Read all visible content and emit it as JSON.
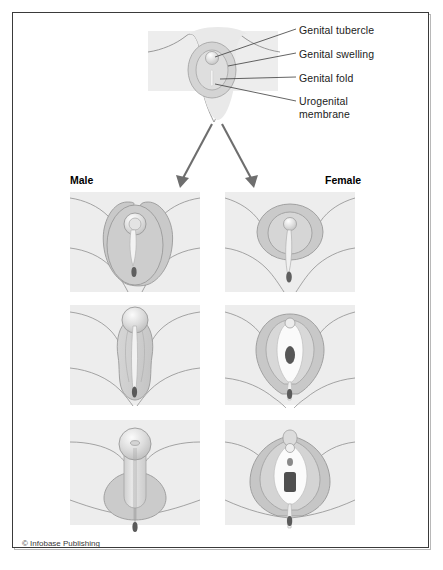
{
  "figure": {
    "credit": "© Infobase Publishing",
    "border_color": "#3a3a3a",
    "background": "#ffffff"
  },
  "callouts": {
    "items": [
      {
        "id": "genital-tubercle",
        "label": "Genital tubercle",
        "leader_from_x": 213,
        "leader_from_y": 58,
        "leader_to_x": 296,
        "leader_to_y": 29
      },
      {
        "id": "genital-swelling",
        "label": "Genital swelling",
        "leader_from_x": 226,
        "leader_from_y": 66,
        "leader_to_x": 296,
        "leader_to_y": 53
      },
      {
        "id": "genital-fold",
        "label": "Genital fold",
        "leader_from_x": 218,
        "leader_from_y": 79,
        "leader_to_x": 296,
        "leader_to_y": 77
      },
      {
        "id": "urogenital-membrane",
        "label": "Urogenital\nmembrane",
        "leader_from_x": 214,
        "leader_from_y": 84,
        "leader_to_x": 296,
        "leader_to_y": 101
      }
    ],
    "line_color": "#3c3c3c"
  },
  "callout_labels": {
    "genital_tubercle": "Genital tubercle",
    "genital_swelling": "Genital swelling",
    "genital_fold": "Genital fold",
    "urogenital_membrane": "Urogenital membrane"
  },
  "columns": {
    "male_label": "Male",
    "female_label": "Female"
  },
  "arrows": {
    "color": "#6e6e6e",
    "left": {
      "x1": 212,
      "y1": 122,
      "x2": 180,
      "y2": 186
    },
    "right": {
      "x1": 222,
      "y1": 122,
      "x2": 254,
      "y2": 186
    }
  },
  "panels": {
    "indifferent": {
      "name": "indifferent-stage",
      "x": 148,
      "y": 31,
      "w": 130,
      "h": 60
    },
    "rows": [
      {
        "stage": 1,
        "male": {
          "x": 70,
          "y": 192,
          "w": 130,
          "h": 100
        },
        "female": {
          "x": 225,
          "y": 192,
          "w": 130,
          "h": 100
        }
      },
      {
        "stage": 2,
        "male": {
          "x": 70,
          "y": 305,
          "w": 130,
          "h": 100
        },
        "female": {
          "x": 225,
          "y": 305,
          "w": 130,
          "h": 100
        }
      },
      {
        "stage": 3,
        "male": {
          "x": 70,
          "y": 420,
          "w": 130,
          "h": 105
        },
        "female": {
          "x": 225,
          "y": 420,
          "w": 130,
          "h": 105
        }
      }
    ]
  },
  "palette": {
    "panel_bg": "#ededed",
    "tissue_light": "#e3e3e3",
    "tissue_mid": "#d2d2d2",
    "tissue_dark": "#bcbcbc",
    "outline": "#8a8a8a",
    "outline_soft": "#a8a8a8",
    "orifice_dark": "#6a6a6a",
    "orifice_darker": "#4a4a4a",
    "highlight": "#f6f6f6"
  }
}
